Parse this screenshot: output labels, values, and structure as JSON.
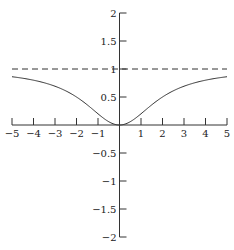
{
  "chart_data": {
    "type": "line",
    "title": "",
    "xlabel": "",
    "ylabel": "",
    "xlim": [
      -5,
      5
    ],
    "ylim": [
      -2,
      2
    ],
    "grid": false,
    "x_ticks": [
      -5,
      -4,
      -3,
      -2,
      -1,
      1,
      2,
      3,
      4,
      5
    ],
    "x_tick_labels": [
      "−5",
      "−4",
      "−3",
      "−2",
      "−1",
      "1",
      "2",
      "3",
      "4",
      "5"
    ],
    "y_ticks": [
      2,
      1.5,
      1,
      0.5,
      -0.5,
      -1,
      -1.5,
      -2
    ],
    "y_tick_labels": [
      "2",
      "1.5",
      "1",
      "0.5",
      "−0.5",
      "−1",
      "−1.5",
      "−2"
    ],
    "series": [
      {
        "name": "f(x) = x²/(x²+4)",
        "style": "solid",
        "x": [
          -5,
          -4,
          -3,
          -2,
          -1,
          0,
          1,
          2,
          3,
          4,
          5
        ],
        "values": [
          0.86,
          0.8,
          0.69,
          0.5,
          0.2,
          0,
          0.2,
          0.5,
          0.69,
          0.8,
          0.86
        ]
      },
      {
        "name": "asymptote y = 1",
        "style": "dashed",
        "x": [
          -5,
          5
        ],
        "values": [
          1,
          1
        ]
      }
    ],
    "colors": {
      "axis": "#333333",
      "curve": "#333333",
      "asymptote": "#333333"
    }
  }
}
